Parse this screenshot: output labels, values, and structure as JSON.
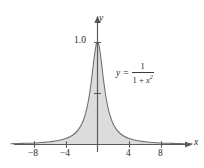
{
  "figure": {
    "kind": "function-graph",
    "background_color": "#ffffff",
    "curve_color": "#6e6e6e",
    "fill_color": "#dcdcdc",
    "axis_color": "#5a5a5a",
    "text_color": "#2b2b2b"
  },
  "axes": {
    "x_axis_name": "x",
    "y_axis_name": "y",
    "x_ticks": [
      {
        "value": -8,
        "label": "−8",
        "px": 34
      },
      {
        "value": -4,
        "label": "−4",
        "px": 66
      },
      {
        "value": 4,
        "label": "4",
        "px": 129
      },
      {
        "value": 8,
        "label": "8",
        "px": 161
      }
    ],
    "y_ticks": [
      {
        "value": 1.0,
        "label": "1.0",
        "px": 42
      },
      {
        "value": 0.5,
        "label": "",
        "px": 93
      }
    ]
  },
  "equation": {
    "lhs": "y",
    "equals": "=",
    "numerator": "1",
    "denominator_lead": "1 +",
    "denominator_var": "x",
    "denominator_exp": "2",
    "plain": "y = 1 / (1 + x²)"
  },
  "chart_data": {
    "type": "line",
    "title": "",
    "subtitle": "",
    "xlabel": "x",
    "ylabel": "y",
    "xlim": [
      -11.0,
      12.0
    ],
    "ylim": [
      0,
      1.18
    ],
    "grid": false,
    "legend": null,
    "fill_to_zero": true,
    "annotations": [
      {
        "text": "y = 1/(1 + x²)",
        "x": 2.4,
        "y": 0.62
      }
    ],
    "series": [
      {
        "name": "y = 1/(1 + x^2)",
        "formula": "1/(1+x*x)",
        "x": [
          -11,
          -10,
          -9,
          -8,
          -7,
          -6,
          -5,
          -4,
          -3.5,
          -3,
          -2.5,
          -2,
          -1.75,
          -1.5,
          -1.25,
          -1,
          -0.85,
          -0.7,
          -0.55,
          -0.4,
          -0.3,
          -0.2,
          -0.1,
          0,
          0.1,
          0.2,
          0.3,
          0.4,
          0.55,
          0.7,
          0.85,
          1,
          1.25,
          1.5,
          1.75,
          2,
          2.5,
          3,
          3.5,
          4,
          5,
          6,
          7,
          8,
          9,
          10,
          11,
          12
        ],
        "y": [
          0.008,
          0.01,
          0.012,
          0.015,
          0.02,
          0.027,
          0.038,
          0.059,
          0.075,
          0.1,
          0.138,
          0.2,
          0.246,
          0.308,
          0.39,
          0.5,
          0.581,
          0.671,
          0.768,
          0.862,
          0.917,
          0.962,
          0.99,
          1.0,
          0.99,
          0.962,
          0.917,
          0.862,
          0.768,
          0.671,
          0.581,
          0.5,
          0.39,
          0.308,
          0.246,
          0.2,
          0.138,
          0.1,
          0.075,
          0.059,
          0.038,
          0.027,
          0.02,
          0.015,
          0.012,
          0.01,
          0.008,
          0.007
        ]
      }
    ]
  }
}
